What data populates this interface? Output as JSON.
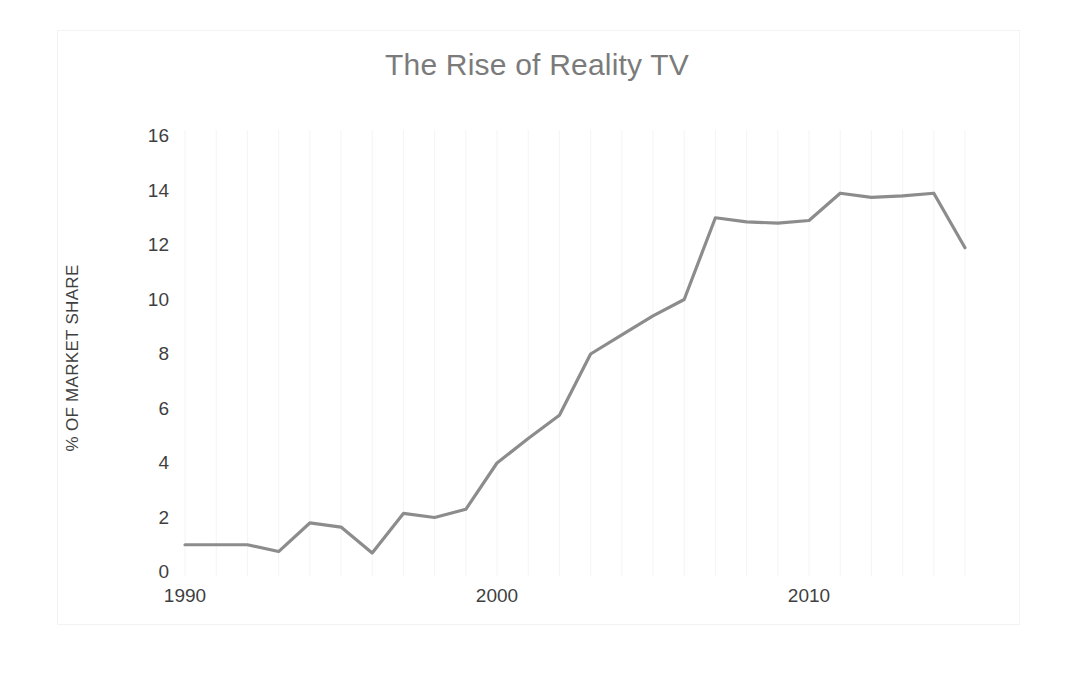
{
  "chart_data": {
    "type": "line",
    "title": "The Rise of Reality TV",
    "xlabel": "",
    "ylabel": "% OF MARKET SHARE",
    "x": [
      1990,
      1991,
      1992,
      1993,
      1994,
      1995,
      1996,
      1997,
      1998,
      1999,
      2000,
      2001,
      2002,
      2003,
      2004,
      2005,
      2006,
      2007,
      2008,
      2009,
      2010,
      2011,
      2012,
      2013,
      2014,
      2015
    ],
    "values": [
      1.0,
      1.0,
      1.0,
      0.75,
      1.8,
      1.65,
      0.7,
      2.15,
      2.0,
      2.3,
      4.0,
      4.9,
      5.75,
      8.0,
      8.7,
      9.4,
      10.0,
      13.0,
      12.85,
      12.8,
      12.9,
      13.9,
      13.75,
      13.8,
      13.9,
      11.9
    ],
    "series": [
      {
        "name": "Reality TV market share",
        "color": "#8c8c8c",
        "values": [
          1.0,
          1.0,
          1.0,
          0.75,
          1.8,
          1.65,
          0.7,
          2.15,
          2.0,
          2.3,
          4.0,
          4.9,
          5.75,
          8.0,
          8.7,
          9.4,
          10.0,
          13.0,
          12.85,
          12.8,
          12.9,
          13.9,
          13.75,
          13.8,
          13.9,
          11.9
        ]
      }
    ],
    "xlim": [
      1990,
      2015
    ],
    "ylim": [
      0,
      16
    ],
    "y_ticks": [
      "0",
      "2",
      "4",
      "6",
      "8",
      "10",
      "12",
      "14",
      "16"
    ],
    "y_tick_values": [
      0,
      2,
      4,
      6,
      8,
      10,
      12,
      14,
      16
    ],
    "x_ticks": [
      "1990",
      "2000",
      "2010"
    ],
    "x_tick_values": [
      1990,
      2000,
      2010
    ],
    "grid": "faint vertical gridlines only",
    "legend": "none",
    "line_color": "#8c8c8c",
    "title_color": "#7b7b7b",
    "tick_label_color": "#3f3f3f",
    "background_color": "#ffffff",
    "frame_color": "#f3f3f3"
  }
}
